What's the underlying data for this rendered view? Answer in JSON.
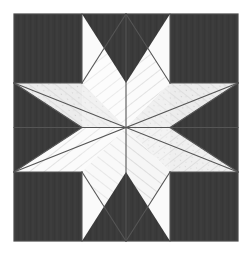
{
  "artwork": {
    "title": "Eight-Pointed Star Quilt Block",
    "pattern_name": "LeMoyne Star",
    "canvas": {
      "width": 250,
      "height": 255
    },
    "background_color": "#ffffff"
  },
  "geometry": {
    "block": {
      "left": 14,
      "top": 14,
      "right": 238,
      "bottom": 241
    },
    "center": {
      "x": 126,
      "y": 127.5
    },
    "inner_left": 82,
    "inner_right": 170,
    "inner_top": 83,
    "inner_bottom": 172,
    "outline_color": "#4a4a4a",
    "outline_width": 1
  },
  "colors": {
    "dark_fabric": "#3a3a3a",
    "dark_fabric_shade": "#333333",
    "light_fabric_a": "#fbfbfb",
    "light_fabric_b": "#f2f2f2",
    "light_fabric_c": "#e9e9e9",
    "light_fabric_d": "#ededed",
    "seam_line": "#555555",
    "stripe_line": "#bdbdbd",
    "speckle": "#9a9a9a"
  },
  "pieces": {
    "corner_squares": [
      {
        "name": "corner-square-top-left",
        "fill": "dark_fabric",
        "points": "14,14 82,14 82,83 14,83"
      },
      {
        "name": "corner-square-top-right",
        "fill": "dark_fabric",
        "points": "170,14 238,14 238,83 170,83"
      },
      {
        "name": "corner-square-bottom-left",
        "fill": "dark_fabric",
        "points": "14,172 82,172 82,241 14,241"
      },
      {
        "name": "corner-square-bottom-right",
        "fill": "dark_fabric",
        "points": "170,172 238,172 238,241 170,241"
      }
    ],
    "edge_triangles": [
      {
        "name": "edge-triangle-top",
        "fill": "dark_fabric",
        "points": "82,14 170,14 126,83"
      },
      {
        "name": "edge-triangle-bottom",
        "fill": "dark_fabric",
        "points": "82,241 170,241 126,172"
      },
      {
        "name": "edge-triangle-left",
        "fill": "dark_fabric",
        "points": "14,83 14,172 82,127.5"
      },
      {
        "name": "edge-triangle-right",
        "fill": "dark_fabric",
        "points": "238,83 238,172 170,127.5"
      }
    ],
    "star_diamonds": [
      {
        "name": "star-diamond-n",
        "label": "north",
        "fill": "light_fabric_a",
        "points": "126,127.5 82,83 126,14 170,83",
        "stripe_angle": -38,
        "speckled": false
      },
      {
        "name": "star-diamond-ne",
        "label": "northeast",
        "fill": "light_fabric_c",
        "points": "126,127.5 170,83 238,83 170,127.5",
        "stripe_angle": 38,
        "speckled": true
      },
      {
        "name": "star-diamond-e",
        "label": "east",
        "fill": "light_fabric_b",
        "points": "126,127.5 170,83 238,83 170,127.5",
        "stripe_angle": 38,
        "speckled": false
      },
      {
        "name": "star-diamond-se",
        "label": "southeast",
        "fill": "light_fabric_d",
        "points": "126,127.5 170,127.5 170,172 126,241",
        "stripe_angle": -38,
        "speckled": true
      },
      {
        "name": "star-diamond-s",
        "label": "south",
        "fill": "light_fabric_a",
        "points": "126,127.5 82,172 126,241 170,172",
        "stripe_angle": 38,
        "speckled": false
      },
      {
        "name": "star-diamond-sw",
        "label": "southwest",
        "fill": "light_fabric_b",
        "points": "126,127.5 82,127.5 14,172 82,172",
        "stripe_angle": -38,
        "speckled": false
      },
      {
        "name": "star-diamond-w",
        "label": "west",
        "fill": "light_fabric_a",
        "points": "126,127.5 82,83 14,83 82,127.5",
        "stripe_angle": 38,
        "speckled": false
      },
      {
        "name": "star-diamond-nw",
        "label": "northwest",
        "fill": "light_fabric_c",
        "points": "126,127.5 82,83 14,83 82,127.5",
        "stripe_angle": 38,
        "speckled": true
      }
    ]
  },
  "seams": {
    "radial_lines": [
      {
        "name": "seam-center-to-n",
        "x1": 126,
        "y1": 127.5,
        "x2": 126,
        "y2": 14
      },
      {
        "name": "seam-center-to-ne",
        "x1": 126,
        "y1": 127.5,
        "x2": 238,
        "y2": 83
      },
      {
        "name": "seam-center-to-e",
        "x1": 126,
        "y1": 127.5,
        "x2": 238,
        "y2": 127.5
      },
      {
        "name": "seam-center-to-se",
        "x1": 126,
        "y1": 127.5,
        "x2": 238,
        "y2": 172
      },
      {
        "name": "seam-center-to-s",
        "x1": 126,
        "y1": 127.5,
        "x2": 126,
        "y2": 241
      },
      {
        "name": "seam-center-to-sw",
        "x1": 126,
        "y1": 127.5,
        "x2": 14,
        "y2": 172
      },
      {
        "name": "seam-center-to-w",
        "x1": 126,
        "y1": 127.5,
        "x2": 14,
        "y2": 127.5
      },
      {
        "name": "seam-center-to-nw",
        "x1": 126,
        "y1": 127.5,
        "x2": 14,
        "y2": 83
      }
    ],
    "diamond_edges": [
      {
        "name": "seam-edge-n-w",
        "x1": 82,
        "y1": 83,
        "x2": 126,
        "y2": 14
      },
      {
        "name": "seam-edge-n-e",
        "x1": 170,
        "y1": 83,
        "x2": 126,
        "y2": 14
      },
      {
        "name": "seam-edge-s-w",
        "x1": 82,
        "y1": 172,
        "x2": 126,
        "y2": 241
      },
      {
        "name": "seam-edge-s-e",
        "x1": 170,
        "y1": 172,
        "x2": 126,
        "y2": 241
      },
      {
        "name": "seam-edge-w-n",
        "x1": 82,
        "y1": 83,
        "x2": 14,
        "y2": 83
      },
      {
        "name": "seam-edge-w-s",
        "x1": 82,
        "y1": 127.5,
        "x2": 14,
        "y2": 83
      },
      {
        "name": "seam-edge-sw-n",
        "x1": 82,
        "y1": 127.5,
        "x2": 14,
        "y2": 172
      },
      {
        "name": "seam-edge-sw-s",
        "x1": 82,
        "y1": 172,
        "x2": 14,
        "y2": 172
      },
      {
        "name": "seam-edge-ne-n",
        "x1": 170,
        "y1": 83,
        "x2": 238,
        "y2": 83
      },
      {
        "name": "seam-edge-ne-s",
        "x1": 170,
        "y1": 127.5,
        "x2": 238,
        "y2": 83
      },
      {
        "name": "seam-edge-se-n",
        "x1": 170,
        "y1": 127.5,
        "x2": 238,
        "y2": 172
      },
      {
        "name": "seam-edge-se-s",
        "x1": 170,
        "y1": 172,
        "x2": 238,
        "y2": 172
      },
      {
        "name": "seam-inner-top-l",
        "x1": 82,
        "y1": 83,
        "x2": 82,
        "y2": 14
      },
      {
        "name": "seam-inner-top-r",
        "x1": 170,
        "y1": 83,
        "x2": 170,
        "y2": 14
      },
      {
        "name": "seam-inner-bottom-l",
        "x1": 82,
        "y1": 172,
        "x2": 82,
        "y2": 241
      },
      {
        "name": "seam-inner-bottom-r",
        "x1": 170,
        "y1": 172,
        "x2": 170,
        "y2": 241
      }
    ]
  }
}
